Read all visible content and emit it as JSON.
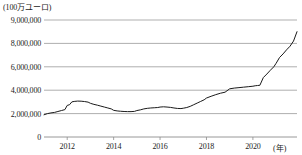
{
  "chart_data": {
    "type": "line",
    "title": "",
    "unit_label": "(100万ユーロ)",
    "xlabel": "(年)",
    "ylabel": "",
    "grid": true,
    "legend_position": "none",
    "xlim": [
      2011.0,
      2021.9
    ],
    "ylim": [
      0,
      9000000
    ],
    "y_ticks": [
      0,
      2000000,
      4000000,
      6000000,
      8000000,
      9000000
    ],
    "y_tick_labels": [
      "0",
      "2,000,000",
      "4,000,000",
      "6,000,000",
      "8,000,000",
      "9,000,000"
    ],
    "x_ticks": [
      2012,
      2014,
      2016,
      2018,
      2020
    ],
    "x_tick_labels": [
      "2012",
      "2014",
      "2016",
      "2018",
      "2020"
    ],
    "line_color": "#1a1a1a",
    "grid_color": "#8d8d8d",
    "series": [
      {
        "name": "残高",
        "x": [
          2011.0,
          2011.15,
          2011.3,
          2011.45,
          2011.6,
          2011.75,
          2011.9,
          2012.0,
          2012.1,
          2012.2,
          2012.3,
          2012.45,
          2012.6,
          2012.75,
          2012.9,
          2013.0,
          2013.15,
          2013.3,
          2013.45,
          2013.6,
          2013.75,
          2013.9,
          2014.0,
          2014.15,
          2014.3,
          2014.45,
          2014.6,
          2014.75,
          2014.9,
          2015.0,
          2015.15,
          2015.3,
          2015.45,
          2015.6,
          2015.75,
          2015.9,
          2016.0,
          2016.15,
          2016.3,
          2016.45,
          2016.6,
          2016.75,
          2016.9,
          2017.0,
          2017.15,
          2017.3,
          2017.45,
          2017.6,
          2017.75,
          2017.9,
          2018.0,
          2018.2,
          2018.4,
          2018.6,
          2018.8,
          2019.0,
          2019.2,
          2019.4,
          2019.6,
          2019.8,
          2020.0,
          2020.1,
          2020.2,
          2020.3,
          2020.45,
          2020.6,
          2020.75,
          2020.9,
          2021.0,
          2021.15,
          2021.3,
          2021.45,
          2021.6,
          2021.75,
          2021.9
        ],
        "values": [
          1900000,
          2000000,
          2060000,
          2100000,
          2180000,
          2260000,
          2340000,
          2700000,
          2760000,
          3000000,
          3040000,
          3070000,
          3060000,
          3030000,
          2980000,
          2880000,
          2790000,
          2720000,
          2640000,
          2560000,
          2480000,
          2400000,
          2280000,
          2230000,
          2200000,
          2180000,
          2170000,
          2170000,
          2190000,
          2260000,
          2320000,
          2400000,
          2450000,
          2480000,
          2500000,
          2520000,
          2560000,
          2580000,
          2560000,
          2530000,
          2480000,
          2440000,
          2430000,
          2460000,
          2520000,
          2620000,
          2760000,
          2900000,
          3040000,
          3180000,
          3330000,
          3480000,
          3620000,
          3740000,
          3830000,
          4120000,
          4180000,
          4220000,
          4260000,
          4300000,
          4340000,
          4380000,
          4400000,
          4420000,
          5080000,
          5380000,
          5700000,
          6000000,
          6300000,
          6800000,
          7100000,
          7450000,
          7760000,
          8100000,
          8500000
        ]
      }
    ]
  },
  "axis": {
    "unit_label": "(100万ユーロ)",
    "x_title": "(年)"
  }
}
